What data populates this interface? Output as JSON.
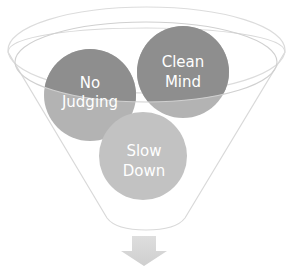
{
  "diagram": {
    "type": "funnel",
    "colors": {
      "background": "#ffffff",
      "funnel_outline": "#d9d9d9",
      "circle_dark": "#8c8c8c",
      "circle_light": "#b0b0b0",
      "circle_lightest": "#c2c2c2",
      "arrow": "#d6d6d6",
      "label": "#ffffff"
    },
    "items": [
      {
        "line1": "No",
        "line2": "Judging"
      },
      {
        "line1": "Clean",
        "line2": "Mind"
      },
      {
        "line1": "Slow",
        "line2": "Down"
      }
    ],
    "arrow": "down-arrow"
  }
}
